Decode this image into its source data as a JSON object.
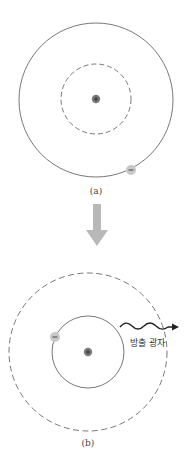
{
  "panels": [
    {
      "id": "a",
      "label": "(a)",
      "description": "Electron in outer (excited) orbit; inner orbit dashed",
      "nucleus_symbol": "+",
      "electron_symbol": "−"
    },
    {
      "id": "b",
      "label": "(b)",
      "description": "Electron drops to inner orbit; outer orbit dashed; photon emitted",
      "nucleus_symbol": "+",
      "electron_symbol": "−",
      "photon_label": "방출 광자"
    }
  ],
  "colors": {
    "orbit": "#555555",
    "nucleus": "#7a7a7a",
    "electron": "#c8c8c8",
    "transition_arrow": "#b8b8b8",
    "photon": "#222222"
  }
}
